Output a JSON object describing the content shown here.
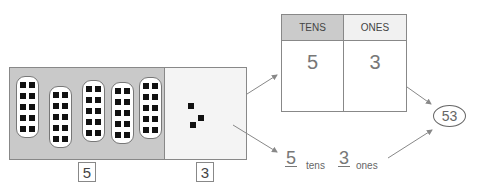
{
  "blocks": {
    "tens_strips": 5,
    "units_per_strip": 10,
    "ones_units": 3,
    "tens_count_label": "5",
    "ones_count_label": "3"
  },
  "place_value_table": {
    "headers": [
      "TENS",
      "ONES"
    ],
    "values": [
      "5",
      "3"
    ]
  },
  "expanded_form": {
    "tens_digit": "5",
    "tens_word": "tens",
    "ones_digit": "3",
    "ones_word": "ones"
  },
  "result": "53",
  "colors": {
    "tens_region": "#c9c9c9",
    "ones_region": "#f4f4f4",
    "tens_header": "#cbcbcb",
    "ones_header": "#f1f1f1",
    "unit_square": "#111111",
    "arrow": "#888888"
  }
}
